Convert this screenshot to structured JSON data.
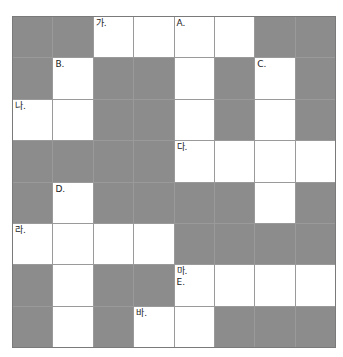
{
  "title": "",
  "grid": {
    "rows": 8,
    "cols": 8,
    "colors": {
      "dark": "#8c8c8c",
      "light": "#ffffff",
      "line": "#9a9a9a"
    },
    "cells": [
      [
        {
          "t": "d"
        },
        {
          "t": "d"
        },
        {
          "t": "w",
          "label": "가."
        },
        {
          "t": "w"
        },
        {
          "t": "w",
          "label": "A."
        },
        {
          "t": "w"
        },
        {
          "t": "d"
        },
        {
          "t": "d"
        }
      ],
      [
        {
          "t": "d"
        },
        {
          "t": "w",
          "label": "B."
        },
        {
          "t": "d"
        },
        {
          "t": "d"
        },
        {
          "t": "w"
        },
        {
          "t": "d"
        },
        {
          "t": "w",
          "label": "C."
        },
        {
          "t": "d"
        }
      ],
      [
        {
          "t": "w",
          "label": "나."
        },
        {
          "t": "w"
        },
        {
          "t": "d"
        },
        {
          "t": "d"
        },
        {
          "t": "w"
        },
        {
          "t": "d"
        },
        {
          "t": "w"
        },
        {
          "t": "d"
        }
      ],
      [
        {
          "t": "d"
        },
        {
          "t": "d"
        },
        {
          "t": "d"
        },
        {
          "t": "d"
        },
        {
          "t": "w",
          "label": "다."
        },
        {
          "t": "w"
        },
        {
          "t": "w"
        },
        {
          "t": "w"
        }
      ],
      [
        {
          "t": "d"
        },
        {
          "t": "w",
          "label": "D."
        },
        {
          "t": "d"
        },
        {
          "t": "d"
        },
        {
          "t": "d"
        },
        {
          "t": "d"
        },
        {
          "t": "w"
        },
        {
          "t": "d"
        }
      ],
      [
        {
          "t": "w",
          "label": "라."
        },
        {
          "t": "w"
        },
        {
          "t": "w"
        },
        {
          "t": "w"
        },
        {
          "t": "d"
        },
        {
          "t": "d"
        },
        {
          "t": "d"
        },
        {
          "t": "d"
        }
      ],
      [
        {
          "t": "d"
        },
        {
          "t": "w"
        },
        {
          "t": "d"
        },
        {
          "t": "d"
        },
        {
          "t": "w",
          "label": "마.\nE."
        },
        {
          "t": "w"
        },
        {
          "t": "w"
        },
        {
          "t": "w"
        }
      ],
      [
        {
          "t": "d"
        },
        {
          "t": "w"
        },
        {
          "t": "d"
        },
        {
          "t": "w",
          "label": "바."
        },
        {
          "t": "w"
        },
        {
          "t": "d"
        },
        {
          "t": "d"
        },
        {
          "t": "d"
        }
      ]
    ]
  }
}
